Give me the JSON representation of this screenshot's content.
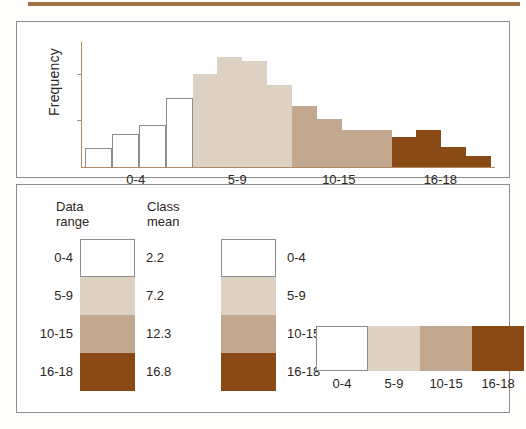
{
  "figure": {
    "top_rule_color": "#9d7344",
    "panel_border_color": "#8d8d8d"
  },
  "palette": {
    "class_0_4": "#ffffff",
    "class_5_9": "#ddd1c3",
    "class_10_15": "#c2a88f",
    "class_16_18": "#8a4a15",
    "outline": "#8d8d8d"
  },
  "chart_data": {
    "type": "bar",
    "title": "",
    "xlabel": "",
    "ylabel": "Frequency",
    "grid": false,
    "legend_position": "below-panel",
    "categories": [
      "0-4-b1",
      "0-4-b2",
      "0-4-b3",
      "0-4-b4",
      "5-9-b1",
      "5-9-b2",
      "5-9-b3",
      "5-9-b4",
      "10-15-b1",
      "10-15-b2",
      "10-15-b3",
      "10-15-b4",
      "16-18-b1",
      "16-18-b2",
      "16-18-b3",
      "16-18-b4"
    ],
    "values": [
      17,
      29,
      37,
      61,
      82,
      97,
      93,
      72,
      54,
      42,
      33,
      33,
      26,
      33,
      18,
      10
    ],
    "ylim": [
      0,
      110
    ],
    "group_tick_labels": [
      "0-4",
      "5-9",
      "10-15",
      "16-18"
    ],
    "bar_colors": [
      "#ffffff",
      "#ffffff",
      "#ffffff",
      "#ffffff",
      "#ddd1c3",
      "#ddd1c3",
      "#ddd1c3",
      "#ddd1c3",
      "#c2a88f",
      "#c2a88f",
      "#c2a88f",
      "#c2a88f",
      "#8a4a15",
      "#8a4a15",
      "#8a4a15",
      "#8a4a15"
    ],
    "bar_outlined": [
      true,
      true,
      true,
      true,
      false,
      false,
      false,
      false,
      false,
      false,
      false,
      false,
      false,
      false,
      false,
      false
    ],
    "y_ticks_visible": 2
  },
  "legend": {
    "header_data_range": "Data\nrange",
    "header_data_range_line1": "Data",
    "header_data_range_line2": "range",
    "header_class_mean": "Class",
    "header_class_mean_line2": "mean",
    "rows": [
      {
        "range": "0-4",
        "class_mean": "2.2",
        "color": "#ffffff",
        "outlined": true
      },
      {
        "range": "5-9",
        "class_mean": "7.2",
        "color": "#ddd1c3",
        "outlined": false
      },
      {
        "range": "10-15",
        "class_mean": "12.3",
        "color": "#c2a88f",
        "outlined": false
      },
      {
        "range": "16-18",
        "class_mean": "16.8",
        "color": "#8a4a15",
        "outlined": false
      }
    ]
  },
  "strip": {
    "cells": [
      {
        "label": "0-4",
        "color": "#ffffff",
        "outlined": true
      },
      {
        "label": "5-9",
        "color": "#ddd1c3",
        "outlined": false
      },
      {
        "label": "10-15",
        "color": "#c2a88f",
        "outlined": false
      },
      {
        "label": "16-18",
        "color": "#8a4a15",
        "outlined": false
      }
    ]
  }
}
